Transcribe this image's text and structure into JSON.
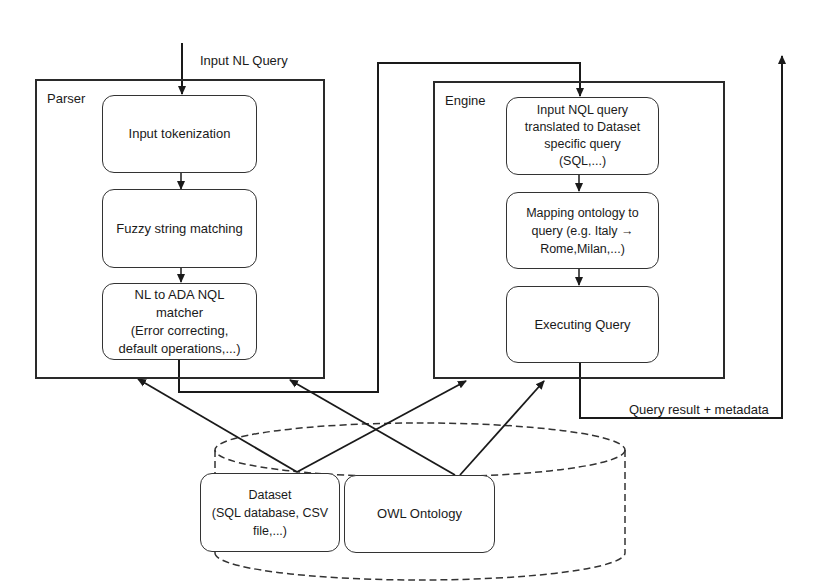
{
  "diagram": {
    "input_label": "Input NL Query",
    "output_label": "Query result + metadata",
    "parser": {
      "title": "Parser",
      "steps": [
        {
          "label": "Input tokenization"
        },
        {
          "label": "Fuzzy string matching"
        },
        {
          "label": "NL to  ADA  NQL\nmatcher\n(Error correcting,\ndefault operations,...)"
        }
      ]
    },
    "engine": {
      "title": "Engine",
      "steps": [
        {
          "label": "Input NQL query\ntranslated to Dataset\nspecific query\n(SQL,...)"
        },
        {
          "label": "Mapping ontology to\nquery (e.g. Italy →\nRome,Milan,...)"
        },
        {
          "label": "Executing Query"
        }
      ]
    },
    "storage": {
      "items": [
        {
          "label": "Dataset\n(SQL database, CSV\nfile,...)"
        },
        {
          "label": "OWL Ontology"
        }
      ]
    },
    "colors": {
      "line": "#1a1a1a",
      "box_border": "#333333",
      "background": "#ffffff"
    }
  }
}
